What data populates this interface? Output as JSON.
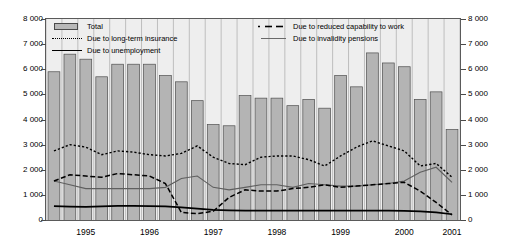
{
  "chart_data": {
    "type": "bar",
    "title": "",
    "xlabel": "",
    "ylabel": "",
    "ylim": [
      0,
      8000
    ],
    "ytick_values": [
      0,
      1000,
      2000,
      3000,
      4000,
      5000,
      6000,
      7000,
      8000
    ],
    "ytick_labels": [
      "0",
      "1 000",
      "2 000",
      "3 000",
      "4 000",
      "5 000",
      "6 000",
      "7 000",
      "8 000"
    ],
    "ytick_labels_right": [
      "0",
      "1 000",
      "2 000",
      "3 000",
      "4 000",
      "5 000",
      "6 000",
      "7 000",
      "8 000"
    ],
    "grid": true,
    "grid_axis": "x",
    "legend_position": "top-inside",
    "x_axis_labels": [
      "1995",
      "1996",
      "1997",
      "1998",
      "1999",
      "2000",
      "2001"
    ],
    "x_label_indices": [
      2,
      6,
      10,
      14,
      18,
      22,
      25
    ],
    "categories": [
      "1994Q3",
      "1994Q4",
      "1995Q1",
      "1995Q2",
      "1995Q3",
      "1995Q4",
      "1996Q1",
      "1996Q2",
      "1996Q3",
      "1996Q4",
      "1997Q1",
      "1997Q2",
      "1997Q3",
      "1997Q4",
      "1998Q1",
      "1998Q2",
      "1998Q3",
      "1998Q4",
      "1999Q1",
      "1999Q2",
      "1999Q3",
      "1999Q4",
      "2000Q1",
      "2000Q2",
      "2000Q3",
      "2000Q4"
    ],
    "series": [
      {
        "name": "Total",
        "style": "bar",
        "values": [
          5900,
          6600,
          6400,
          5700,
          6200,
          6200,
          6200,
          5750,
          5500,
          4750,
          3800,
          3750,
          4950,
          4850,
          4850,
          4550,
          4800,
          4450,
          5750,
          5300,
          6650,
          6250,
          6100,
          4800,
          5100,
          3600
        ]
      },
      {
        "name": "Due to long-term insurance",
        "style": "dotted",
        "values": [
          2750,
          3000,
          2900,
          2600,
          2750,
          2700,
          2600,
          2550,
          2650,
          2950,
          2500,
          2250,
          2200,
          2500,
          2550,
          2550,
          2400,
          2150,
          2550,
          2900,
          3150,
          2950,
          2750,
          2150,
          2250,
          1700
        ]
      },
      {
        "name": "Due to reduced capability to work",
        "style": "dashed",
        "values": [
          1550,
          1800,
          1750,
          1700,
          1850,
          1800,
          1750,
          1450,
          300,
          250,
          350,
          900,
          1200,
          1150,
          1150,
          1250,
          1300,
          1400,
          1300,
          1350,
          1400,
          1450,
          1500,
          1150,
          700,
          200
        ]
      },
      {
        "name": "Due to invalidity pensions",
        "style": "thin-solid",
        "values": [
          1550,
          1400,
          1250,
          1250,
          1250,
          1250,
          1250,
          1300,
          1650,
          1750,
          1300,
          1200,
          1300,
          1400,
          1400,
          1300,
          1450,
          1400,
          1350,
          1350,
          1400,
          1450,
          1550,
          1900,
          2100,
          1500
        ]
      },
      {
        "name": "Due to unemployment",
        "style": "thick-solid",
        "values": [
          550,
          530,
          520,
          540,
          560,
          560,
          550,
          540,
          500,
          450,
          400,
          380,
          370,
          370,
          370,
          370,
          370,
          370,
          370,
          370,
          370,
          370,
          360,
          340,
          300,
          230
        ]
      }
    ],
    "colors": {
      "bar_fill": "#b4b4b4",
      "bar_edge": "#4f4f4f",
      "plot_background": "#eeeeee",
      "grid": "#8e8e8e",
      "line_black": "#000000",
      "line_gray": "#5f5f5f"
    }
  },
  "legend": {
    "items": [
      {
        "label": "Total",
        "symbol": "filled-box-swatch"
      },
      {
        "label": "Due to long-term insurance",
        "symbol": "dotted-line-swatch"
      },
      {
        "label": "Due to unemployment",
        "symbol": "solid-thick-line-swatch"
      },
      {
        "label": "Due to reduced capability to work",
        "symbol": "dash-dot-line-swatch"
      },
      {
        "label": "Due to invalidity pensions",
        "symbol": "solid-thin-line-swatch"
      }
    ]
  }
}
